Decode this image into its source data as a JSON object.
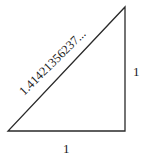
{
  "diagram": {
    "type": "right-triangle",
    "vertices": {
      "bottom_left": [
        8,
        131
      ],
      "bottom_right": [
        125,
        131
      ],
      "top_right": [
        125,
        7
      ]
    },
    "labels": {
      "hypotenuse": "1.41421356237...",
      "vertical_leg": "1",
      "horizontal_leg": "1"
    },
    "stroke_color": "#2a2a2a",
    "text_color": "#1a1a1a"
  }
}
